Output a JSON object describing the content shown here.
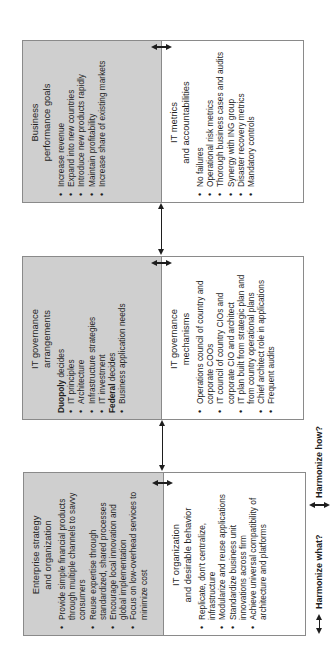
{
  "orientation": "rotated -90deg",
  "colors": {
    "gray_fill": "#cfcfcf",
    "border": "#8a8a8a",
    "arrow": "#1e1e1e"
  },
  "boxes": {
    "business_goals": {
      "title_line1": "Business",
      "title_line2": "performance goals",
      "items": [
        "Increase revenue",
        "Expand into new countries",
        "Introduce new products rapidly",
        "Maintain profitability",
        "Increase share of existing markets"
      ]
    },
    "it_metrics": {
      "title_line1": "IT metrics",
      "title_line2": "and accountabilities",
      "items": [
        "No failures",
        "Operational risk metrics",
        "Thorough business cases and audits",
        "Synergy with ING group",
        "Disaster recovery metrics",
        "Mandatory controls"
      ]
    },
    "governance_arrangements": {
      "title_line1": "IT governance",
      "title_line2": "arrangements",
      "groups": [
        {
          "bold": "Duopoly",
          "rest": " decides",
          "items": [
            "IT principles",
            "Architecture",
            "Infrastructure strategies",
            "IT investment"
          ]
        },
        {
          "bold": "Federal",
          "rest": " decides",
          "items": [
            "Business application needs"
          ]
        }
      ]
    },
    "governance_mechanisms": {
      "title_line1": "IT governance",
      "title_line2": "mechanisms",
      "items": [
        "Operations council of country and corporate COOs",
        "IT council of country CIOs and corporate CIO and architect",
        "IT plan built from strategic plan and from country operational plans",
        "Chief architect role in applications",
        "Frequent audits"
      ]
    },
    "enterprise_strategy": {
      "title_line1": "Enterprise strategy",
      "title_line2": "and organization",
      "items": [
        "Provide simple financial products through multiple channels to savvy consumers",
        "Reuse expertise through standardized, shared processes",
        "Encourage local innovation and global implementation",
        "Focus on low-overhead services to minimize cost"
      ]
    },
    "it_organization": {
      "title_line1": "IT organization",
      "title_line2": "and desirable behavior",
      "items": [
        "Replicate, don't centralize, infrastructure",
        "Modularize and reuse applications",
        "Standardize business unit innovations across firm",
        "Achieve universal compatibility of architecture and platforms"
      ]
    }
  },
  "legend": {
    "what_label": "Harmonize what?",
    "how_label": "Harmonize how?"
  }
}
